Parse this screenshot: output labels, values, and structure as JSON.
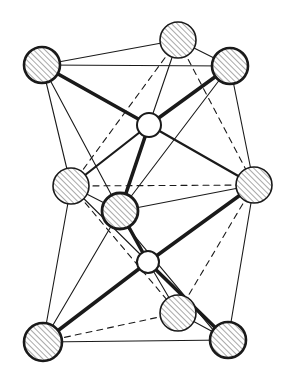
{
  "diagram": {
    "title": "",
    "type": "crystal-structure-coordination",
    "background": "#ffffff",
    "line_color": "#1a1a1a",
    "hatch_color": "#7a7a7a",
    "atoms": [
      {
        "id": "TL",
        "kind": "large",
        "x": 42,
        "y": 65,
        "r": 18,
        "outline": 2.6
      },
      {
        "id": "TB",
        "kind": "large",
        "x": 178,
        "y": 40,
        "r": 18,
        "outline": 1.6
      },
      {
        "id": "TR",
        "kind": "large",
        "x": 230,
        "y": 66,
        "r": 18,
        "outline": 2.6
      },
      {
        "id": "S1",
        "kind": "small",
        "x": 149,
        "y": 125,
        "r": 12,
        "outline": 2.0
      },
      {
        "id": "ML",
        "kind": "large",
        "x": 71,
        "y": 186,
        "r": 18,
        "outline": 1.6
      },
      {
        "id": "MR",
        "kind": "large",
        "x": 254,
        "y": 185,
        "r": 18,
        "outline": 1.6
      },
      {
        "id": "MF",
        "kind": "large",
        "x": 120,
        "y": 211,
        "r": 18,
        "outline": 2.8
      },
      {
        "id": "S2",
        "kind": "small",
        "x": 148,
        "y": 262,
        "r": 11,
        "outline": 2.0
      },
      {
        "id": "BB",
        "kind": "large",
        "x": 178,
        "y": 313,
        "r": 18,
        "outline": 1.6
      },
      {
        "id": "BL",
        "kind": "large",
        "x": 43,
        "y": 342,
        "r": 19,
        "outline": 2.6
      },
      {
        "id": "BR",
        "kind": "large",
        "x": 228,
        "y": 340,
        "r": 18,
        "outline": 2.6
      }
    ],
    "bonds": [
      {
        "from": "TL",
        "to": "TB",
        "style": "thin"
      },
      {
        "from": "TL",
        "to": "TR",
        "style": "thin"
      },
      {
        "from": "TB",
        "to": "TR",
        "style": "thin"
      },
      {
        "from": "TL",
        "to": "ML",
        "style": "thin"
      },
      {
        "from": "TL",
        "to": "MF",
        "style": "thin"
      },
      {
        "from": "TR",
        "to": "MR",
        "style": "thin"
      },
      {
        "from": "TR",
        "to": "MF",
        "style": "thin"
      },
      {
        "from": "TB",
        "to": "ML",
        "style": "dashed"
      },
      {
        "from": "TB",
        "to": "MR",
        "style": "dashed"
      },
      {
        "from": "ML",
        "to": "MR",
        "style": "dashed"
      },
      {
        "from": "TL",
        "to": "S1",
        "style": "thick"
      },
      {
        "from": "TR",
        "to": "S1",
        "style": "thick"
      },
      {
        "from": "TB",
        "to": "S1",
        "style": "thin"
      },
      {
        "from": "S1",
        "to": "ML",
        "style": "medium"
      },
      {
        "from": "S1",
        "to": "MR",
        "style": "medium"
      },
      {
        "from": "S1",
        "to": "MF",
        "style": "thick"
      },
      {
        "from": "ML",
        "to": "MF",
        "style": "thin"
      },
      {
        "from": "MF",
        "to": "MR",
        "style": "thin"
      },
      {
        "from": "ML",
        "to": "BL",
        "style": "thin"
      },
      {
        "from": "MF",
        "to": "BL",
        "style": "thin"
      },
      {
        "from": "MR",
        "to": "BR",
        "style": "thin"
      },
      {
        "from": "ML",
        "to": "BB",
        "style": "dashed"
      },
      {
        "from": "MR",
        "to": "BB",
        "style": "dashed"
      },
      {
        "from": "BL",
        "to": "BB",
        "style": "dashed"
      },
      {
        "from": "BL",
        "to": "BR",
        "style": "thin"
      },
      {
        "from": "BB",
        "to": "BR",
        "style": "thin"
      },
      {
        "from": "ML",
        "to": "S2",
        "style": "thin"
      },
      {
        "from": "MF",
        "to": "S2",
        "style": "thick"
      },
      {
        "from": "MF",
        "to": "BR",
        "style": "thin",
        "offset": 5
      },
      {
        "from": "MR",
        "to": "S2",
        "style": "thick"
      },
      {
        "from": "BL",
        "to": "S2",
        "style": "thick"
      },
      {
        "from": "S2",
        "to": "BB",
        "style": "thin"
      },
      {
        "from": "S2",
        "to": "BR",
        "style": "thick"
      }
    ],
    "labels": []
  }
}
